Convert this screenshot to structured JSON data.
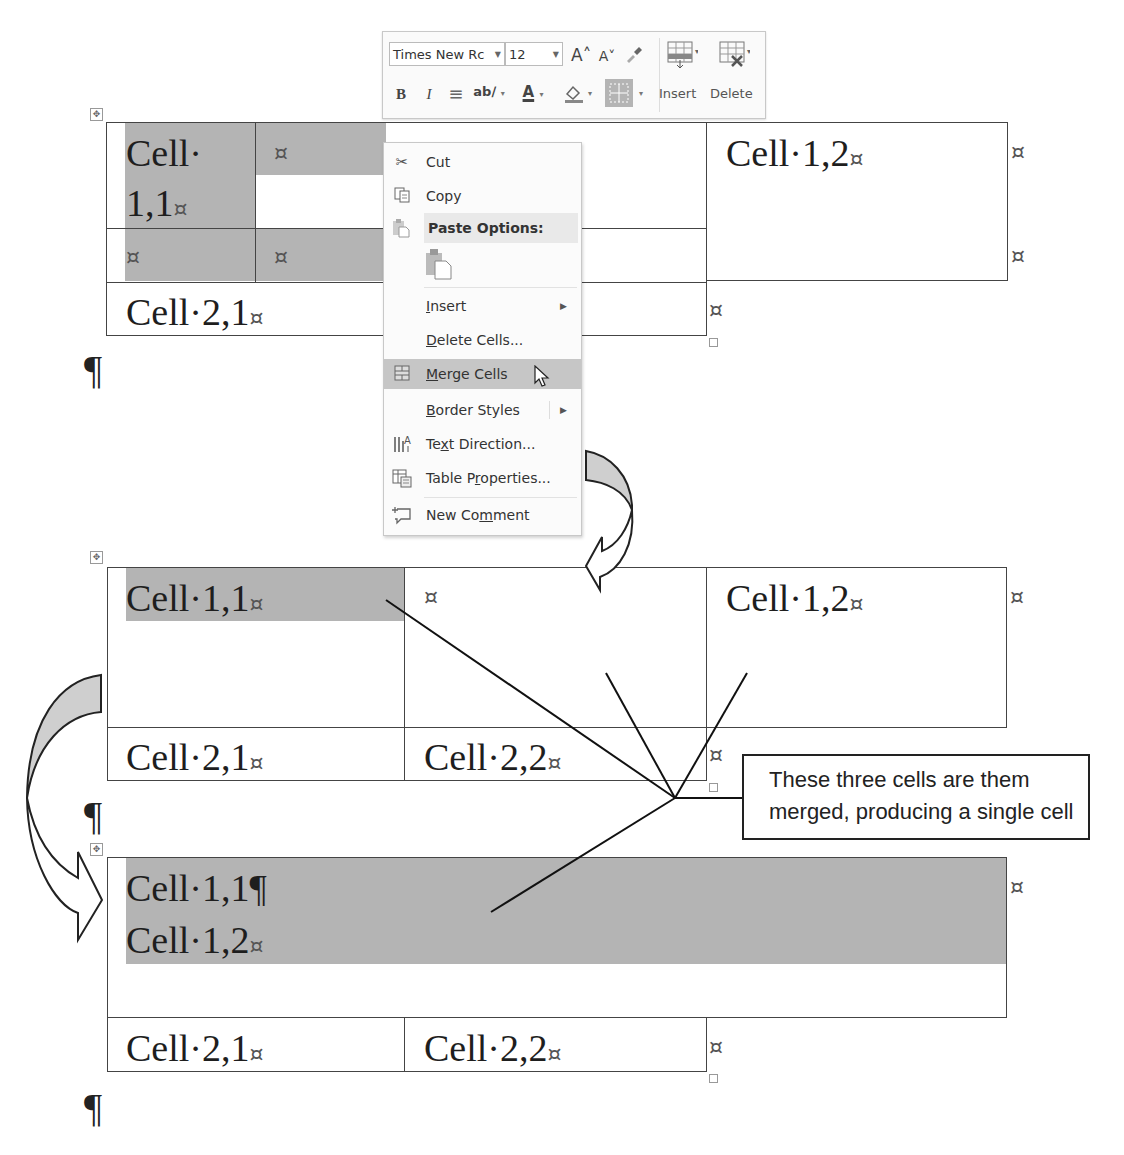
{
  "mini_toolbar": {
    "font_name": "Times New Rc",
    "font_size": "12",
    "grow_font_icon": "A˄",
    "shrink_font_icon": "A˅",
    "format_painter_icon": "paintbrush-icon",
    "bold": "B",
    "italic": "I",
    "center_icon": "≡",
    "highlight_icon": "ab∕",
    "font_color": "A",
    "shading_icon": "paint-bucket-icon",
    "borders_icon": "borders-icon",
    "insert_label": "Insert",
    "delete_label": "Delete"
  },
  "context_menu": {
    "items": [
      {
        "label": "Cut",
        "icon": "scissors-icon"
      },
      {
        "label": "Copy",
        "icon": "copy-icon"
      },
      {
        "label": "Paste Options:",
        "icon": "paste-icon"
      },
      {
        "label": "",
        "icon": "paste-keep-source-icon"
      },
      {
        "label": "Insert",
        "submenu": true
      },
      {
        "label": "Delete Cells..."
      },
      {
        "label": "Merge Cells",
        "icon": "merge-cells-icon",
        "highlighted": true
      },
      {
        "label": "Border Styles",
        "submenu": true
      },
      {
        "label": "Text Direction...",
        "icon": "text-direction-icon"
      },
      {
        "label": "Table Properties...",
        "icon": "table-properties-icon"
      },
      {
        "label": "New Comment",
        "icon": "new-comment-icon"
      }
    ]
  },
  "table_before": {
    "cell_11_line1": "Cell·",
    "cell_11_line2": "1,1",
    "cell_12": "Cell·1,2",
    "cell_21": "Cell·2,1",
    "end_mark": "¤"
  },
  "table_middle": {
    "cell_11": "Cell·1,1",
    "cell_12": "Cell·1,2",
    "cell_21": "Cell·2,1",
    "cell_22": "Cell·2,2",
    "end_mark": "¤"
  },
  "table_after": {
    "merged_line1": "Cell·1,1¶",
    "merged_line2": "Cell·1,2",
    "cell_21": "Cell·2,1",
    "cell_22": "Cell·2,2",
    "end_mark": "¤"
  },
  "pilcrow": "¶",
  "move_handle": "✥",
  "callout": {
    "line1": "These three cells are them",
    "line2": "merged, producing a single cell"
  },
  "colors": {
    "selection": "#b4b4b4",
    "menu_highlight": "#c6c6c6",
    "border": "#444444"
  }
}
